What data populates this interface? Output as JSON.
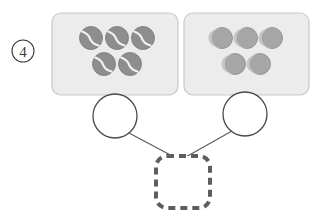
{
  "figure": {
    "index_label": "4",
    "index_style": "circled-number",
    "background_color": "#ffffff"
  },
  "palette": {
    "panel_fill": "#ececec",
    "panel_stroke": "#c9c9c9",
    "tennis_ball_fill": "#8e8e8e",
    "tennis_ball_stroke": "#7a7a7a",
    "tennis_ball_seam": "#f2f2f2",
    "plain_ball_fill": "#a6a6a6",
    "plain_ball_stroke": "#8f8f8f",
    "plain_ball_highlight": "#c4c4c4",
    "node_circle_fill": "#ffffff",
    "node_circle_stroke": "#4a4a4a",
    "connector_stroke": "#5a5a5a",
    "dashed_box_stroke": "#5e5e5e",
    "dashed_box_fill": "#ffffff",
    "index_text_color": "#3b3b3b"
  },
  "panels": [
    {
      "name": "left-panel",
      "x": 52,
      "y": 13,
      "width": 126,
      "height": 82,
      "radius": 9,
      "item_type": "tennis-ball",
      "item_count": 5,
      "items": [
        {
          "cx": 91,
          "cy": 38,
          "r": 11.5
        },
        {
          "cx": 117,
          "cy": 38,
          "r": 11.5
        },
        {
          "cx": 143,
          "cy": 38,
          "r": 11.5
        },
        {
          "cx": 104,
          "cy": 64,
          "r": 11.5
        },
        {
          "cx": 130,
          "cy": 64,
          "r": 11.5
        }
      ]
    },
    {
      "name": "right-panel",
      "x": 184,
      "y": 13,
      "width": 125,
      "height": 82,
      "radius": 9,
      "item_type": "plain-ball",
      "item_count": 5,
      "items": [
        {
          "cx": 222,
          "cy": 38,
          "r": 10.5
        },
        {
          "cx": 247,
          "cy": 38,
          "r": 10.5
        },
        {
          "cx": 272,
          "cy": 38,
          "r": 10.5
        },
        {
          "cx": 235,
          "cy": 64,
          "r": 10.5
        },
        {
          "cx": 260,
          "cy": 64,
          "r": 10.5
        }
      ]
    }
  ],
  "nodes": [
    {
      "name": "left-node-circle",
      "cx": 115,
      "cy": 116,
      "r": 22
    },
    {
      "name": "right-node-circle",
      "cx": 245,
      "cy": 114,
      "r": 22
    }
  ],
  "connectors": [
    {
      "name": "left-connector",
      "x1": 129,
      "y1": 133,
      "x2": 176,
      "y2": 158
    },
    {
      "name": "right-connector",
      "x1": 232,
      "y1": 131,
      "x2": 184,
      "y2": 158
    }
  ],
  "target_box": {
    "name": "dashed-target-box",
    "x": 156,
    "y": 156,
    "width": 54,
    "height": 52,
    "radius": 11,
    "stroke_width": 4,
    "dash_pattern": "7 5",
    "content": ""
  },
  "index_marker": {
    "cx": 23,
    "cy": 51,
    "r": 11,
    "label": "4"
  }
}
